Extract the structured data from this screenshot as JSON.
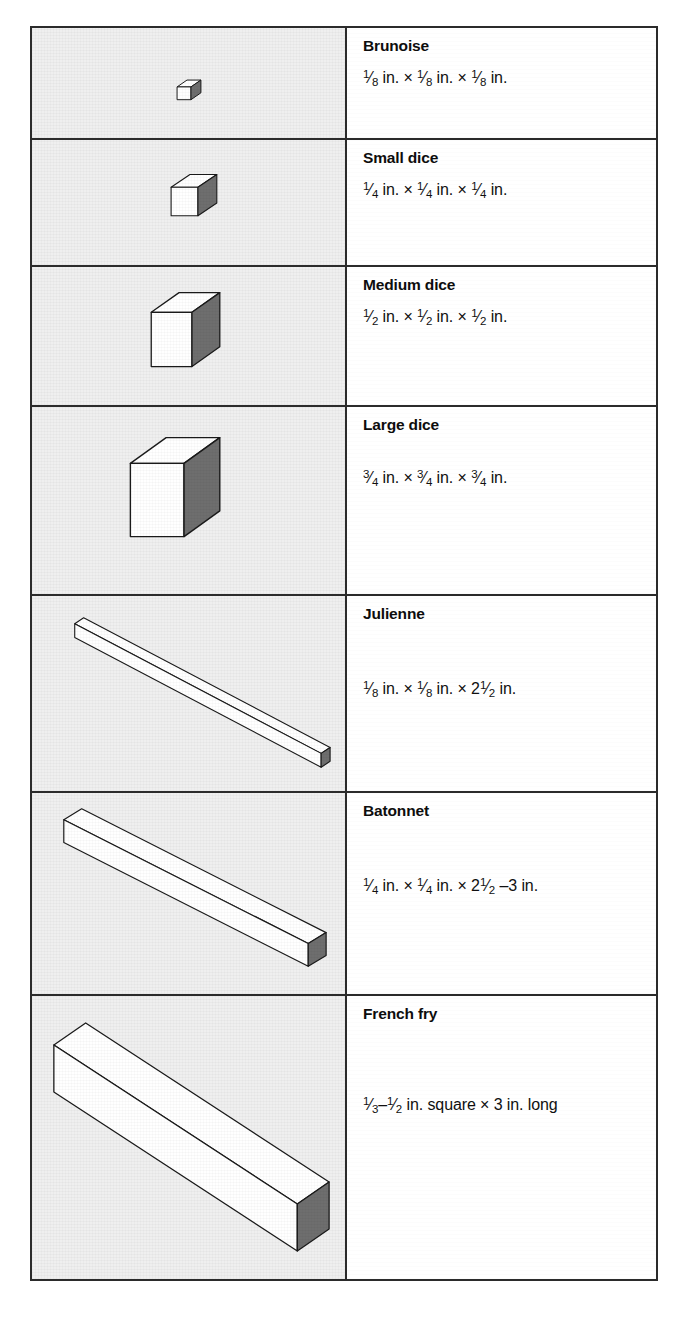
{
  "table": {
    "title": "Knife cut sizes",
    "columns": [
      "illustration",
      "cut name and dimensions"
    ],
    "border_color": "#2b2b2b",
    "figure_cell_bg": "#efefef",
    "cube_face_colors": {
      "top": "#ffffff",
      "left": "#ffffff",
      "right_shaded": "#6e6e6e",
      "outline": "#1a1a1a"
    },
    "rows": [
      {
        "name": "Brunoise",
        "shape": "cube",
        "dimensions_plain": "1/8 in. x 1/8 in. x 1/8 in.",
        "parts": [
          {
            "type": "frac",
            "n": "1",
            "d": "8"
          },
          {
            "type": "text",
            "t": " in. × "
          },
          {
            "type": "frac",
            "n": "1",
            "d": "8"
          },
          {
            "type": "text",
            "t": " in. × "
          },
          {
            "type": "frac",
            "n": "1",
            "d": "8"
          },
          {
            "type": "text",
            "t": " in."
          }
        ],
        "dims_position": "near"
      },
      {
        "name": "Small dice",
        "shape": "cube",
        "dimensions_plain": "1/4 in. x 1/4 in. x 1/4 in.",
        "parts": [
          {
            "type": "frac",
            "n": "1",
            "d": "4"
          },
          {
            "type": "text",
            "t": " in. × "
          },
          {
            "type": "frac",
            "n": "1",
            "d": "4"
          },
          {
            "type": "text",
            "t": " in. × "
          },
          {
            "type": "frac",
            "n": "1",
            "d": "4"
          },
          {
            "type": "text",
            "t": " in."
          }
        ],
        "dims_position": "near"
      },
      {
        "name": "Medium dice",
        "shape": "cube",
        "dimensions_plain": "1/2 in. x 1/2 in. x 1/2 in.",
        "parts": [
          {
            "type": "frac",
            "n": "1",
            "d": "2"
          },
          {
            "type": "text",
            "t": " in. × "
          },
          {
            "type": "frac",
            "n": "1",
            "d": "2"
          },
          {
            "type": "text",
            "t": " in. × "
          },
          {
            "type": "frac",
            "n": "1",
            "d": "2"
          },
          {
            "type": "text",
            "t": " in."
          }
        ],
        "dims_position": "near"
      },
      {
        "name": "Large dice",
        "shape": "cube",
        "dimensions_plain": "3/4 in. x 3/4 in. x 3/4 in.",
        "parts": [
          {
            "type": "frac",
            "n": "3",
            "d": "4"
          },
          {
            "type": "text",
            "t": " in. × "
          },
          {
            "type": "frac",
            "n": "3",
            "d": "4"
          },
          {
            "type": "text",
            "t": " in. × "
          },
          {
            "type": "frac",
            "n": "3",
            "d": "4"
          },
          {
            "type": "text",
            "t": " in."
          }
        ],
        "dims_position": "mid"
      },
      {
        "name": "Julienne",
        "shape": "bar",
        "dimensions_plain": "1/8 in. x 1/8 in. x 2 1/2 in.",
        "parts": [
          {
            "type": "frac",
            "n": "1",
            "d": "8"
          },
          {
            "type": "text",
            "t": " in. × "
          },
          {
            "type": "frac",
            "n": "1",
            "d": "8"
          },
          {
            "type": "text",
            "t": " in. × 2"
          },
          {
            "type": "frac",
            "n": "1",
            "d": "2"
          },
          {
            "type": "text",
            "t": " in."
          }
        ],
        "dims_position": "far"
      },
      {
        "name": "Batonnet",
        "shape": "bar",
        "dimensions_plain": "1/4 in. x 1/4 in. x 2 1/2 - 3 in.",
        "parts": [
          {
            "type": "frac",
            "n": "1",
            "d": "4"
          },
          {
            "type": "text",
            "t": " in. × "
          },
          {
            "type": "frac",
            "n": "1",
            "d": "4"
          },
          {
            "type": "text",
            "t": " in. × 2"
          },
          {
            "type": "frac",
            "n": "1",
            "d": "2"
          },
          {
            "type": "text",
            "t": " –3 in."
          }
        ],
        "dims_position": "far"
      },
      {
        "name": "French fry",
        "shape": "bar",
        "dimensions_plain": "1/3 - 1/2 in. square x 3 in. long",
        "parts": [
          {
            "type": "frac",
            "n": "1",
            "d": "3"
          },
          {
            "type": "text",
            "t": "–"
          },
          {
            "type": "frac",
            "n": "1",
            "d": "2"
          },
          {
            "type": "text",
            "t": " in. square × 3 in. long"
          }
        ],
        "dims_position": "xfar"
      }
    ]
  }
}
